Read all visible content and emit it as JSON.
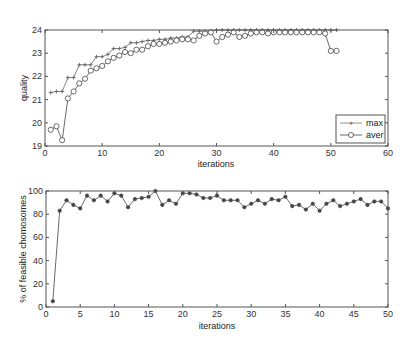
{
  "chart_data": [
    {
      "type": "line",
      "title": "",
      "xlabel": "iterations",
      "ylabel": "quality",
      "xlim": [
        0,
        60
      ],
      "ylim": [
        19,
        24
      ],
      "xticks": [
        0,
        10,
        20,
        30,
        40,
        50,
        60
      ],
      "yticks": [
        19,
        20,
        21,
        22,
        23,
        24
      ],
      "grid": false,
      "legend_position": "bottom-right",
      "series": [
        {
          "name": "max",
          "marker": "+",
          "color": "#666666",
          "x": [
            1,
            2,
            3,
            4,
            5,
            6,
            7,
            8,
            9,
            10,
            11,
            12,
            13,
            14,
            15,
            16,
            17,
            18,
            19,
            20,
            21,
            22,
            23,
            24,
            25,
            26,
            27,
            28,
            29,
            30,
            31,
            32,
            33,
            34,
            35,
            36,
            37,
            38,
            39,
            40,
            41,
            42,
            43,
            44,
            45,
            46,
            47,
            48,
            49,
            50,
            51
          ],
          "values": [
            21.3,
            21.35,
            21.35,
            21.95,
            21.95,
            22.5,
            22.5,
            22.5,
            22.85,
            22.85,
            22.95,
            23.2,
            23.2,
            23.25,
            23.45,
            23.45,
            23.5,
            23.55,
            23.55,
            23.6,
            23.6,
            23.65,
            23.65,
            23.7,
            23.7,
            23.95,
            23.95,
            23.95,
            23.95,
            24.0,
            24.0,
            24.0,
            24.0,
            24.0,
            24.0,
            24.0,
            24.0,
            24.0,
            24.0,
            24.0,
            24.0,
            24.0,
            24.0,
            24.0,
            24.0,
            24.0,
            24.0,
            24.0,
            24.0,
            24.0,
            24.0
          ]
        },
        {
          "name": "aver",
          "marker": "o",
          "color": "#444444",
          "x": [
            1,
            2,
            3,
            4,
            5,
            6,
            7,
            8,
            9,
            10,
            11,
            12,
            13,
            14,
            15,
            16,
            17,
            18,
            19,
            20,
            21,
            22,
            23,
            24,
            25,
            26,
            27,
            28,
            29,
            30,
            31,
            32,
            33,
            34,
            35,
            36,
            37,
            38,
            39,
            40,
            41,
            42,
            43,
            44,
            45,
            46,
            47,
            48,
            49,
            50,
            51
          ],
          "values": [
            19.7,
            19.85,
            19.25,
            21.05,
            21.35,
            21.7,
            21.9,
            22.25,
            22.35,
            22.45,
            22.65,
            22.8,
            22.9,
            23.05,
            23.0,
            23.15,
            23.15,
            23.3,
            23.4,
            23.4,
            23.45,
            23.5,
            23.55,
            23.6,
            23.6,
            23.55,
            23.75,
            23.85,
            23.9,
            23.5,
            23.7,
            23.8,
            23.9,
            23.7,
            23.75,
            23.85,
            23.9,
            23.9,
            23.85,
            23.9,
            23.9,
            23.9,
            23.9,
            23.9,
            23.9,
            23.9,
            23.9,
            23.9,
            23.85,
            23.1,
            23.1
          ]
        }
      ]
    },
    {
      "type": "line",
      "title": "",
      "xlabel": "iterations",
      "ylabel": "% of feasible chomosomes",
      "xlim": [
        0,
        50
      ],
      "ylim": [
        0,
        100
      ],
      "xticks": [
        0,
        5,
        10,
        15,
        20,
        25,
        30,
        35,
        40,
        45,
        50
      ],
      "yticks": [
        0,
        20,
        40,
        60,
        80,
        100
      ],
      "grid": false,
      "series": [
        {
          "name": "feasible",
          "marker": "*",
          "color": "#444444",
          "x": [
            1,
            2,
            3,
            4,
            5,
            6,
            7,
            8,
            9,
            10,
            11,
            12,
            13,
            14,
            15,
            16,
            17,
            18,
            19,
            20,
            21,
            22,
            23,
            24,
            25,
            26,
            27,
            28,
            29,
            30,
            31,
            32,
            33,
            34,
            35,
            36,
            37,
            38,
            39,
            40,
            41,
            42,
            43,
            44,
            45,
            46,
            47,
            48,
            49,
            50
          ],
          "values": [
            5,
            83,
            92,
            88,
            85,
            96,
            92,
            96,
            91,
            98,
            96,
            86,
            93,
            94,
            95,
            100,
            88,
            92,
            89,
            98,
            98,
            97,
            94,
            94,
            96,
            92,
            92,
            92,
            86,
            89,
            92,
            89,
            93,
            92,
            95,
            87,
            88,
            84,
            89,
            83,
            89,
            92,
            87,
            89,
            91,
            93,
            88,
            91,
            91,
            85
          ]
        }
      ]
    }
  ]
}
